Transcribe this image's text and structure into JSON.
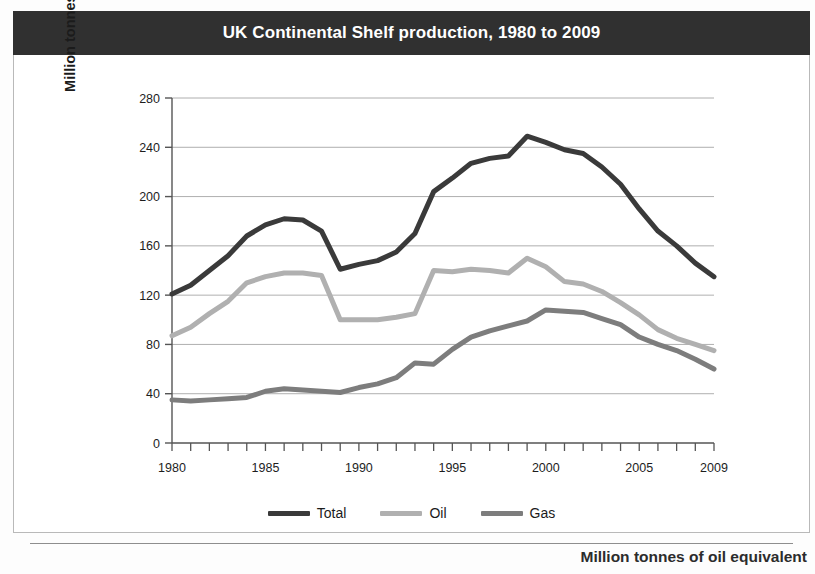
{
  "caption": "Million tonnes of oil equivalent",
  "legend": {
    "position": "bottom-center",
    "items": [
      {
        "label": "Total",
        "color": "#3a3a3a"
      },
      {
        "label": "Oil",
        "color": "#b0b0b0"
      },
      {
        "label": "Gas",
        "color": "#7d7d7d"
      }
    ]
  },
  "colors": {
    "title_bar_bg": "#303030",
    "title_text": "#ffffff",
    "panel_bg": "#ffffff",
    "panel_border": "#b9b9b9",
    "grid": "#9a9a9a",
    "axis": "#555555",
    "total": "#3a3a3a",
    "oil": "#b0b0b0",
    "gas": "#7d7d7d"
  },
  "chart_data": {
    "type": "line",
    "title": "UK Continental Shelf production, 1980 to 2009",
    "xlabel": "",
    "ylabel": "Million tonnes of oil equivalent",
    "xlim": [
      1980,
      2009
    ],
    "ylim": [
      0,
      280
    ],
    "yticks": [
      0,
      40,
      80,
      120,
      160,
      200,
      240,
      280
    ],
    "ytick_labels": [
      "0",
      "40",
      "80",
      "120",
      "160",
      "200",
      "240",
      "280"
    ],
    "xticks": [
      1980,
      1981,
      1982,
      1983,
      1984,
      1985,
      1986,
      1987,
      1988,
      1989,
      1990,
      1991,
      1992,
      1993,
      1994,
      1995,
      1996,
      1997,
      1998,
      1999,
      2000,
      2001,
      2002,
      2003,
      2004,
      2005,
      2006,
      2007,
      2008,
      2009
    ],
    "xtick_labels_shown": [
      "1980",
      "1985",
      "1990",
      "1995",
      "2000",
      "2005",
      "2009"
    ],
    "grid": "horizontal",
    "x": [
      1980,
      1981,
      1982,
      1983,
      1984,
      1985,
      1986,
      1987,
      1988,
      1989,
      1990,
      1991,
      1992,
      1993,
      1994,
      1995,
      1996,
      1997,
      1998,
      1999,
      2000,
      2001,
      2002,
      2003,
      2004,
      2005,
      2006,
      2007,
      2008,
      2009
    ],
    "series": [
      {
        "name": "Total",
        "color": "#3a3a3a",
        "values": [
          121,
          128,
          140,
          152,
          168,
          177,
          182,
          181,
          172,
          141,
          145,
          148,
          155,
          170,
          204,
          215,
          227,
          231,
          233,
          249,
          244,
          238,
          235,
          224,
          210,
          190,
          172,
          160,
          146,
          135
        ]
      },
      {
        "name": "Oil",
        "color": "#b0b0b0",
        "values": [
          87,
          94,
          105,
          115,
          130,
          135,
          138,
          138,
          136,
          100,
          100,
          100,
          102,
          105,
          140,
          139,
          141,
          140,
          138,
          150,
          143,
          131,
          129,
          123,
          114,
          104,
          92,
          85,
          80,
          75
        ]
      },
      {
        "name": "Gas",
        "color": "#7d7d7d",
        "values": [
          35,
          34,
          35,
          36,
          37,
          42,
          44,
          43,
          42,
          41,
          45,
          48,
          53,
          65,
          64,
          76,
          86,
          91,
          95,
          99,
          108,
          107,
          106,
          101,
          96,
          86,
          80,
          75,
          68,
          60
        ]
      }
    ]
  }
}
